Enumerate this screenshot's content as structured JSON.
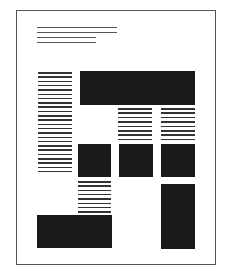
{
  "diagram": {
    "type": "page-layout-wireframe",
    "colors": {
      "border": "#555555",
      "text_line": "#333333",
      "block": "#1a1a1a",
      "background": "#ffffff"
    },
    "page": {
      "x": 16,
      "y": 10,
      "w": 199,
      "h": 254
    },
    "header_lines": [
      {
        "x": 37,
        "y": 27,
        "w": 80
      },
      {
        "x": 37,
        "y": 32,
        "w": 80
      },
      {
        "x": 37,
        "y": 37,
        "w": 59
      },
      {
        "x": 37,
        "y": 42,
        "w": 59
      }
    ],
    "text_columns": [
      {
        "name": "left-column-text",
        "x": 38,
        "y": 72,
        "w": 34,
        "count": 24,
        "pitch": 4.3
      },
      {
        "name": "middle-column-text",
        "x": 118,
        "y": 108,
        "w": 34,
        "count": 8,
        "pitch": 4.4
      },
      {
        "name": "right-column-text",
        "x": 161,
        "y": 108,
        "w": 34,
        "count": 8,
        "pitch": 4.4
      },
      {
        "name": "lower-left-column-text",
        "x": 78,
        "y": 181,
        "w": 33,
        "count": 8,
        "pitch": 4.3
      }
    ],
    "blocks": [
      {
        "name": "top-banner-block",
        "x": 80,
        "y": 71,
        "w": 115,
        "h": 34
      },
      {
        "name": "square-block-left",
        "x": 78,
        "y": 144,
        "w": 33,
        "h": 33
      },
      {
        "name": "square-block-middle",
        "x": 119,
        "y": 144,
        "w": 34,
        "h": 33
      },
      {
        "name": "square-block-right",
        "x": 161,
        "y": 144,
        "w": 34,
        "h": 33
      },
      {
        "name": "tall-block-right",
        "x": 161,
        "y": 184,
        "w": 34,
        "h": 65
      },
      {
        "name": "bottom-wide-block",
        "x": 37,
        "y": 215,
        "w": 75,
        "h": 33
      }
    ]
  }
}
